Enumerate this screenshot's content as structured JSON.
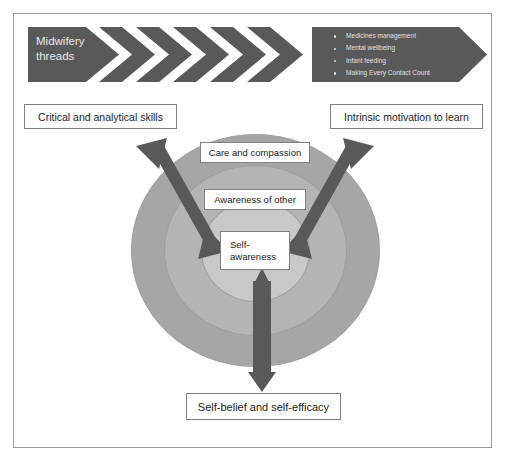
{
  "diagram": {
    "colors": {
      "chevron_fill": "#595959",
      "chevron_text": "#e8e8e8",
      "arrow_fill": "#595959",
      "ring_outer": "#a6a6a6",
      "ring_middle": "#b4b4b4",
      "ring_inner": "#c8c8c8",
      "box_border": "#7f7f7f",
      "box_fill": "#ffffff",
      "text": "#1c1c1c",
      "frame_border": "#9a9a9a"
    }
  },
  "banner": {
    "lead_label": "Midwifery\nthreads",
    "chevron_count": 5,
    "bullets": [
      "Medicines management",
      "Mental wellbeing",
      "Infant feeding",
      "Making Every Contact Count"
    ]
  },
  "boxes": {
    "critical": "Critical and analytical skills",
    "intrinsic": "Intrinsic motivation to learn",
    "selfbelief": "Self-belief and self-efficacy"
  },
  "circles": {
    "outer_label": "Care and compassion",
    "middle_label": "Awareness of other",
    "inner_label": "Self-\nawareness"
  },
  "arrows": {
    "left_diagonal": "double-headed-arrow-up-left",
    "right_diagonal": "double-headed-arrow-up-right",
    "bottom_vertical": "double-headed-arrow-down"
  }
}
